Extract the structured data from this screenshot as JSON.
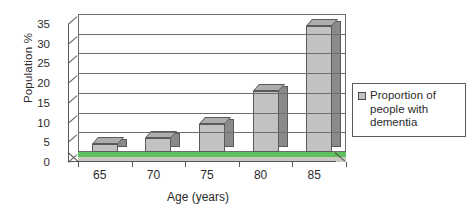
{
  "chart_data": {
    "type": "bar",
    "title": "",
    "subtitle": "",
    "categories": [
      "65",
      "70",
      "75",
      "80",
      "85"
    ],
    "values": [
      2,
      3.5,
      7,
      15.5,
      32
    ],
    "series": [
      {
        "name": "Proportion of people with dementia",
        "values": [
          2,
          3.5,
          7,
          15.5,
          32
        ]
      }
    ],
    "xlabel": "Age (years)",
    "ylabel": "Population %",
    "ylim": [
      0,
      35
    ],
    "yticks": [
      0,
      5,
      10,
      15,
      20,
      25,
      30,
      35
    ],
    "ytick_labels": [
      "0",
      "5",
      "10",
      "15",
      "20",
      "25",
      "30",
      "35"
    ],
    "grid": true,
    "legend_position": "right",
    "style": "3d-column",
    "colors": {
      "bar_face": "#c2c2c2",
      "bar_side": "#8a8a8a",
      "bar_top": "#adadad",
      "bar_outline": "#5a5a5a",
      "gridline": "#6d6d6d",
      "floor": "#5fbf5f",
      "background": "#ffffff",
      "text": "#2b2b2b"
    }
  },
  "axes": {
    "y_title": "Population %",
    "x_title": "Age (years)"
  },
  "legend": {
    "swatch_name": "legend-swatch-series-1",
    "entries": [
      {
        "label": "Proportion of people with dementia"
      }
    ]
  }
}
